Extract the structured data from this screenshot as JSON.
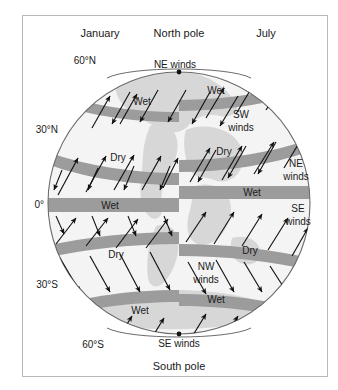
{
  "figure": {
    "clipped_caption_above": "",
    "seasons": {
      "left_label": "January",
      "right_label": "July"
    },
    "poles": {
      "north": "North pole",
      "south": "South pole"
    },
    "latitude_labels": [
      {
        "id": "lat-60n",
        "text": "60°N"
      },
      {
        "id": "lat-30n",
        "text": "30°N"
      },
      {
        "id": "lat-0",
        "text": "0°"
      },
      {
        "id": "lat-30s",
        "text": "30°S"
      },
      {
        "id": "lat-60s",
        "text": "60°S"
      }
    ],
    "band_labels": {
      "jan_wet_60n": "Wet",
      "jan_dry_30n": "Dry",
      "jan_wet_eq": "Wet",
      "jan_dry_30s": "Dry",
      "jan_wet_60s": "Wet",
      "jul_wet_60n": "Wet",
      "jul_dry_30n": "Dry",
      "jul_wet_eq": "Wet",
      "jul_dry_30s": "Dry",
      "jul_wet_60s": "Wet"
    },
    "wind_labels": {
      "ne_winds_top": "NE winds",
      "sw_winds": "SW\nwinds",
      "sw_winds_line1": "SW",
      "sw_winds_line2": "winds",
      "ne_winds_right": "NE\nwinds",
      "ne_winds_right_line1": "NE",
      "ne_winds_right_line2": "winds",
      "se_winds_right": "SE\nwinds",
      "se_winds_right_line1": "SE",
      "se_winds_right_line2": "winds",
      "nw_winds": "NW\nwinds",
      "nw_winds_line1": "NW",
      "nw_winds_line2": "winds",
      "se_winds_bottom": "SE winds"
    },
    "colors": {
      "band": "#9c9c9c",
      "land": "#d7d7d7",
      "ocean": "#f2f2f2",
      "outline": "#5a5a5a",
      "arrow": "#111111",
      "frame": "#b9b9b9",
      "text": "#1a1a1a"
    },
    "geometry": {
      "globe_center_x": 179,
      "globe_center_y": 203,
      "globe_radius": 131,
      "meridian_x": 179
    }
  }
}
